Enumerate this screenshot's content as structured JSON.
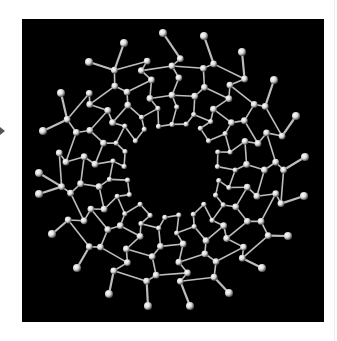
{
  "figure": {
    "background_color": "#000000",
    "atom_color": "#d8d8d8",
    "bond_color": "#bdbdbd",
    "center": [
      172,
      170
    ],
    "hole_radius": 36,
    "outer_atoms": [
      [
        163,
        33
      ],
      [
        204,
        36
      ],
      [
        242,
        52
      ],
      [
        274,
        80
      ],
      [
        296,
        116
      ],
      [
        305,
        157
      ],
      [
        304,
        196
      ],
      [
        288,
        236
      ],
      [
        262,
        268
      ],
      [
        229,
        293
      ],
      [
        190,
        306
      ],
      [
        148,
        306
      ],
      [
        109,
        294
      ],
      [
        77,
        268
      ],
      [
        52,
        234
      ],
      [
        39,
        194
      ],
      [
        39,
        173
      ],
      [
        43,
        131
      ],
      [
        61,
        93
      ],
      [
        89,
        62
      ],
      [
        124,
        43
      ]
    ],
    "inner_ring_radii": [
      48,
      62,
      76,
      90,
      104,
      114
    ],
    "spokes": 21
  },
  "pointer": {
    "icon": "arrow-right-icon"
  }
}
